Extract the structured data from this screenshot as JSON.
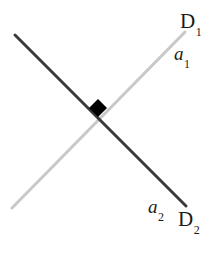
{
  "figure": {
    "background_color": "#ffffff",
    "width": 220,
    "height": 254,
    "labels": {
      "d1": {
        "base": "D",
        "sub": "1"
      },
      "a1": {
        "base": "a",
        "sub": "1"
      },
      "a2": {
        "base": "a",
        "sub": "2"
      },
      "d2": {
        "base": "D",
        "sub": "2"
      }
    },
    "lines": [
      {
        "name": "line-d2",
        "color": "#3a3a3a",
        "width": 3,
        "x1": 15,
        "y1": 35,
        "x2": 186,
        "y2": 206,
        "direction": "top-left-to-bottom-right",
        "labels": [
          "a2",
          "D2"
        ]
      },
      {
        "name": "line-d1",
        "color": "#c8c8c8",
        "width": 3,
        "x1": 12,
        "y1": 208,
        "x2": 185,
        "y2": 32,
        "direction": "bottom-left-to-top-right",
        "labels": [
          "a1",
          "D1"
        ]
      }
    ],
    "marker": {
      "name": "intersection-marker",
      "shape": "diamond",
      "color": "#000000",
      "cx": 98,
      "cy": 108,
      "size": 18
    }
  },
  "chart_data": {
    "type": "line",
    "title": "",
    "xlabel": "",
    "ylabel": "",
    "grid": false,
    "legend_position": "inline-endpoint-labels",
    "annotations": [
      "D1",
      "a1",
      "a2",
      "D2"
    ],
    "series": [
      {
        "name": "D1",
        "color": "#c8c8c8",
        "points": [
          [
            12,
            208
          ],
          [
            185,
            32
          ]
        ],
        "endpoint_labels": {
          "start": "",
          "end": "D1"
        },
        "segment_label": "a1"
      },
      {
        "name": "D2",
        "color": "#3a3a3a",
        "points": [
          [
            15,
            35
          ],
          [
            186,
            206
          ]
        ],
        "endpoint_labels": {
          "start": "",
          "end": "D2"
        },
        "segment_label": "a2"
      }
    ],
    "markers": [
      {
        "name": "intersection",
        "x": 98,
        "y": 108,
        "shape": "diamond",
        "color": "#000000"
      }
    ]
  }
}
